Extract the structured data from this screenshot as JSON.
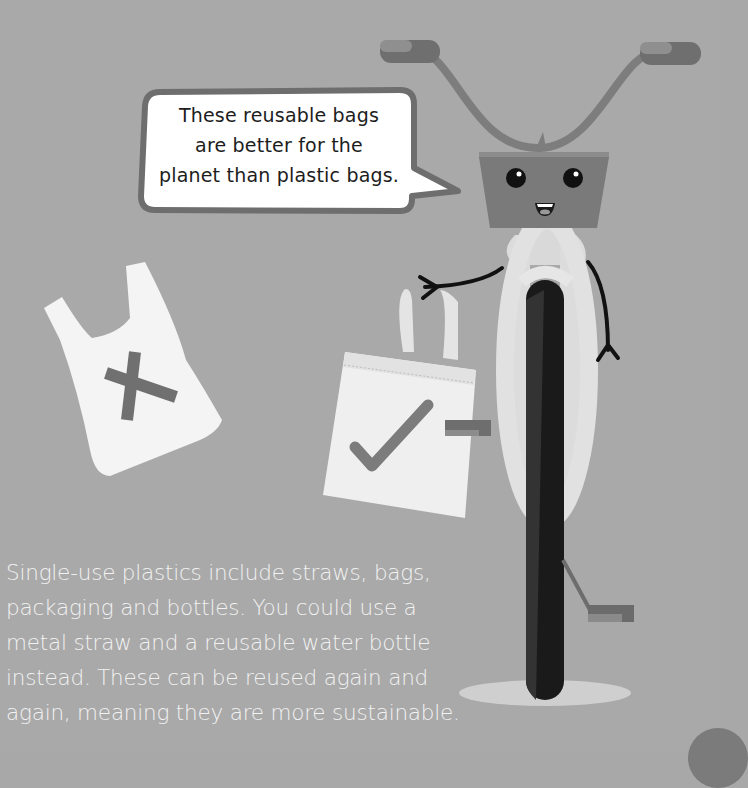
{
  "speech_bubble": {
    "lines": [
      "These reusable bags",
      "are better for the",
      "planet than plastic bags."
    ]
  },
  "body": {
    "lines": [
      "Single-use plastics include straws, bags,",
      "packaging and bottles. You could use a",
      "metal straw and a reusable water bottle",
      "instead. These can be reused again and",
      "again, meaning they are more sustainable."
    ]
  },
  "illustrations": {
    "plastic_bag": {
      "mark": "cross-icon",
      "meaning": "not recommended"
    },
    "reusable_bag": {
      "mark": "check-icon",
      "meaning": "recommended"
    },
    "character": "bicycle-character"
  },
  "colors": {
    "background": "#a9a9a9",
    "bubble_fill": "#ffffff",
    "bubble_border": "#6e6e6e",
    "text_dark": "#1d1d1d",
    "text_light": "#f2f2f2",
    "basket": "#7a7a7a",
    "tire": "#1a1a1a"
  }
}
